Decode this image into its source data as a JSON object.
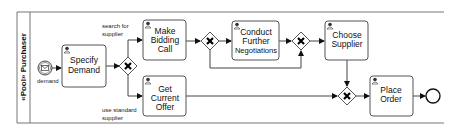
{
  "pool": {
    "label": "«Pool» Purchaser"
  },
  "start_event": {
    "label": "demand"
  },
  "tasks": [
    {
      "id": "specify",
      "lines": [
        "Specify",
        "Demand"
      ]
    },
    {
      "id": "bidding",
      "lines": [
        "Make",
        "Bidding",
        "Call"
      ]
    },
    {
      "id": "offer",
      "lines": [
        "Get",
        "Current",
        "Offer"
      ]
    },
    {
      "id": "negotiate",
      "lines": [
        "Conduct",
        "Further",
        "Negotiations"
      ]
    },
    {
      "id": "choose",
      "lines": [
        "Choose",
        "Supplier"
      ]
    },
    {
      "id": "order",
      "lines": [
        "Place",
        "Order"
      ]
    }
  ],
  "flow_labels": {
    "search": [
      "search for",
      "supplier"
    ],
    "standard": [
      "use standard",
      "supplier"
    ]
  },
  "icons": {
    "task": "user-task-icon",
    "gateway": "exclusive-gateway-x",
    "start": "message-start-event",
    "end": "end-event"
  }
}
